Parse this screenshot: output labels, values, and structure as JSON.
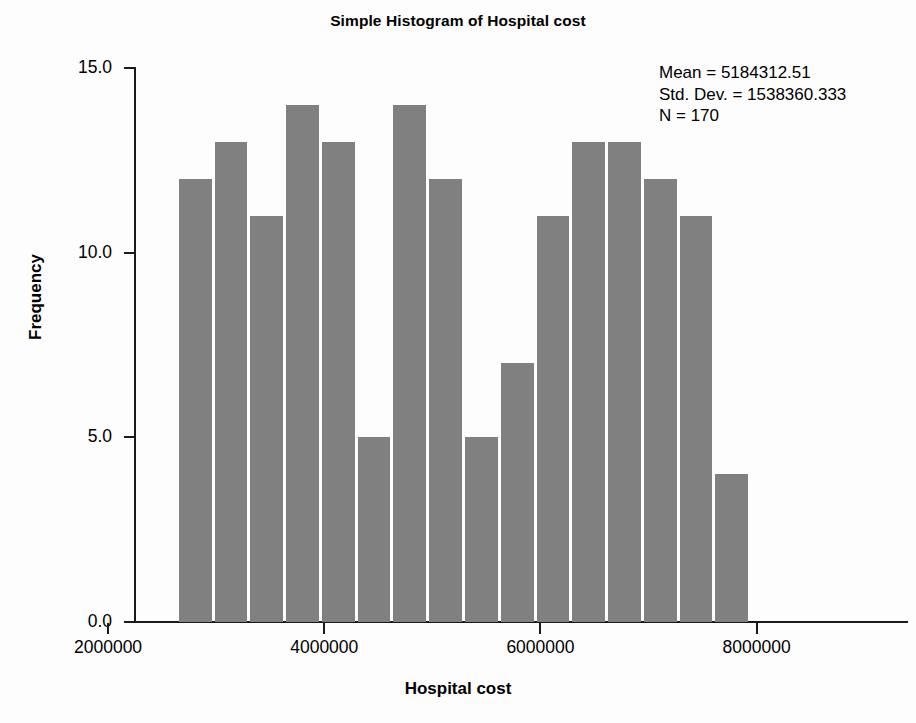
{
  "chart_data": {
    "type": "bar",
    "title": "Simple Histogram of Hospital cost",
    "xlabel": "Hospital cost",
    "ylabel": "Frequency",
    "xlim": [
      2240000,
      9400000
    ],
    "ylim": [
      0,
      15
    ],
    "grid": false,
    "legend": null,
    "bar_color": "#808080",
    "bin_width": 331000,
    "bin_starts": [
      2640000,
      2971000,
      3302000,
      3633000,
      3964000,
      4295000,
      4626000,
      4957000,
      5288000,
      5619000,
      5950000,
      6281000,
      6612000,
      6943000,
      7274000,
      7605000
    ],
    "bin_centers": [
      2805500,
      3136500,
      3467500,
      3798500,
      4129500,
      4460500,
      4791500,
      5122500,
      5453500,
      5784500,
      6115500,
      6446500,
      6777500,
      7108500,
      7439500,
      7770500
    ],
    "values": [
      12,
      13,
      11,
      14,
      13,
      5,
      14,
      12,
      5,
      7,
      11,
      13,
      13,
      12,
      11,
      4
    ],
    "categories": [
      "2640000",
      "2971000",
      "3302000",
      "3633000",
      "3964000",
      "4295000",
      "4626000",
      "4957000",
      "5288000",
      "5619000",
      "5950000",
      "6281000",
      "6612000",
      "6943000",
      "7274000",
      "7605000"
    ],
    "x_ticks": [
      {
        "value": 2000000,
        "label": "2000000"
      },
      {
        "value": 4000000,
        "label": "4000000"
      },
      {
        "value": 6000000,
        "label": "6000000"
      },
      {
        "value": 8000000,
        "label": "8000000"
      }
    ],
    "y_ticks": [
      {
        "value": 0,
        "label": "0.0"
      },
      {
        "value": 5,
        "label": "5.0"
      },
      {
        "value": 10,
        "label": "10.0"
      },
      {
        "value": 15,
        "label": "15.0"
      }
    ],
    "annotations": {
      "mean_label": "Mean = 5184312.51",
      "std_dev_label": "Std. Dev. = 1538360.333",
      "n_label": "N = 170"
    }
  }
}
